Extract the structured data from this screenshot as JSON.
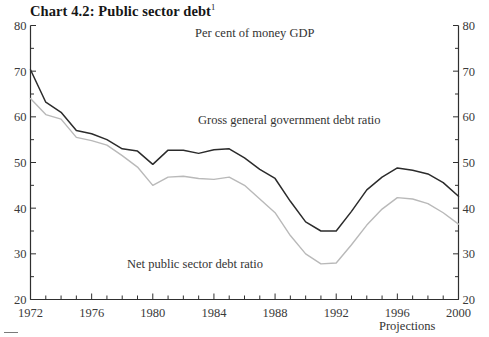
{
  "header": {
    "title": "Chart 4.2: Public sector debt",
    "title_superscript": "1"
  },
  "annotations": {
    "units": "Per cent of money GDP",
    "gross_label": "Gross general government debt ratio",
    "net_label": "Net public sector debt ratio",
    "projections": "Projections"
  },
  "axes": {
    "y_ticks_left": [
      "80",
      "70",
      "60",
      "50",
      "40",
      "30",
      "20"
    ],
    "y_ticks_right": [
      "80",
      "70",
      "60",
      "50",
      "40",
      "30",
      "20"
    ],
    "x_ticks": [
      "1972",
      "1976",
      "1980",
      "1984",
      "1988",
      "1992",
      "1996",
      "2000"
    ]
  },
  "colors": {
    "gross_line": "#2b2b2b",
    "net_line": "#b9b9b9",
    "axis": "#2f2f2f",
    "text": "#333333"
  },
  "chart_data": {
    "type": "line",
    "title": "Chart 4.2: Public sector debt",
    "subtitle": "Per cent of money GDP",
    "xlabel": "",
    "ylabel": "Per cent of money GDP",
    "ylim": [
      20,
      80
    ],
    "xlim": [
      1972,
      2000
    ],
    "grid": false,
    "legend": "inline-annotations",
    "y_major_step": 10,
    "y_minor_step": 5,
    "x_tick_step": 1,
    "x_label_step": 4,
    "x": [
      1972,
      1973,
      1974,
      1975,
      1976,
      1977,
      1978,
      1979,
      1980,
      1981,
      1982,
      1983,
      1984,
      1985,
      1986,
      1987,
      1988,
      1989,
      1990,
      1991,
      1992,
      1993,
      1994,
      1995,
      1996,
      1997,
      1998,
      1999,
      2000
    ],
    "series": [
      {
        "name": "Gross general government debt ratio",
        "color": "#2b2b2b",
        "values": [
          70.3,
          63.2,
          61.0,
          57.0,
          56.3,
          55.0,
          53.0,
          52.5,
          49.6,
          52.7,
          52.7,
          52.0,
          52.8,
          53.0,
          51.0,
          48.5,
          46.5,
          41.5,
          37.0,
          35.0,
          35.0,
          39.3,
          44.0,
          46.8,
          48.8,
          48.3,
          47.5,
          45.6,
          42.6
        ]
      },
      {
        "name": "Net public sector debt ratio",
        "color": "#b9b9b9",
        "values": [
          64.0,
          60.5,
          59.5,
          55.5,
          54.8,
          53.8,
          51.5,
          49.0,
          45.0,
          46.8,
          47.0,
          46.5,
          46.3,
          46.8,
          45.0,
          42.0,
          39.0,
          34.0,
          30.0,
          27.8,
          28.0,
          32.0,
          36.3,
          39.8,
          42.3,
          42.0,
          41.0,
          39.0,
          36.5
        ]
      }
    ],
    "projection_start": 1996
  }
}
